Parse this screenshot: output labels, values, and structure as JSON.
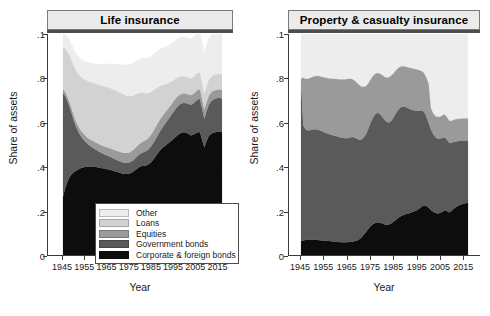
{
  "figure": {
    "panels": [
      {
        "key": "life",
        "title": "Life insurance",
        "ylabel": "Share of assets",
        "xlabel": "Year"
      },
      {
        "key": "pc",
        "title": "Property & casualty insurance",
        "ylabel": "Share of assets",
        "xlabel": "Year"
      }
    ],
    "y_ticks": [
      "0",
      ".2",
      ".4",
      ".6",
      ".8",
      ".1"
    ],
    "y_tick_values": [
      0,
      0.2,
      0.4,
      0.6,
      0.8,
      1.0
    ],
    "x_ticks": [
      "1945",
      "1955",
      "1965",
      "1975",
      "1985",
      "1995",
      "2005",
      "2015"
    ],
    "x_tick_values": [
      1945,
      1955,
      1965,
      1975,
      1985,
      1995,
      2005,
      2015
    ]
  },
  "legend": {
    "items": [
      {
        "label": "Other",
        "color": "#ededed"
      },
      {
        "label": "Loans",
        "color": "#d2d2d2"
      },
      {
        "label": "Equities",
        "color": "#9a9a9a"
      },
      {
        "label": "Government bonds",
        "color": "#5a5a5a"
      },
      {
        "label": "Corporate & foreign bonds",
        "color": "#0d0d0d"
      }
    ]
  },
  "chart_data": [
    {
      "type": "area",
      "stacked": true,
      "title": "Life insurance",
      "xlabel": "Year",
      "ylabel": "Share of assets",
      "xlim": [
        1942,
        2020
      ],
      "ylim": [
        0,
        1
      ],
      "grid": false,
      "legend_position": "inside-bottom-center",
      "x": [
        1945,
        1946,
        1947,
        1948,
        1949,
        1950,
        1951,
        1952,
        1953,
        1954,
        1955,
        1956,
        1957,
        1958,
        1959,
        1960,
        1961,
        1962,
        1963,
        1964,
        1965,
        1966,
        1967,
        1968,
        1969,
        1970,
        1971,
        1972,
        1973,
        1974,
        1975,
        1976,
        1977,
        1978,
        1979,
        1980,
        1981,
        1982,
        1983,
        1984,
        1985,
        1986,
        1987,
        1988,
        1989,
        1990,
        1991,
        1992,
        1993,
        1994,
        1995,
        1996,
        1997,
        1998,
        1999,
        2000,
        2001,
        2002,
        2003,
        2004,
        2005,
        2006,
        2007,
        2008,
        2009,
        2010,
        2011,
        2012,
        2013,
        2014,
        2015,
        2016,
        2017
      ],
      "series": [
        {
          "name": "Corporate & foreign bonds",
          "color": "#0d0d0d",
          "values": [
            0.262,
            0.3,
            0.33,
            0.352,
            0.366,
            0.374,
            0.381,
            0.387,
            0.392,
            0.396,
            0.398,
            0.399,
            0.4,
            0.4,
            0.399,
            0.398,
            0.396,
            0.394,
            0.392,
            0.39,
            0.388,
            0.386,
            0.383,
            0.38,
            0.377,
            0.374,
            0.371,
            0.368,
            0.366,
            0.366,
            0.368,
            0.372,
            0.378,
            0.386,
            0.394,
            0.4,
            0.403,
            0.404,
            0.406,
            0.412,
            0.421,
            0.433,
            0.447,
            0.461,
            0.474,
            0.484,
            0.492,
            0.5,
            0.508,
            0.516,
            0.525,
            0.534,
            0.543,
            0.55,
            0.554,
            0.556,
            0.552,
            0.546,
            0.541,
            0.544,
            0.55,
            0.556,
            0.555,
            0.52,
            0.487,
            0.516,
            0.538,
            0.548,
            0.553,
            0.556,
            0.558,
            0.558,
            0.556
          ]
        },
        {
          "name": "Government bonds",
          "color": "#5a5a5a",
          "values": [
            0.47,
            0.42,
            0.368,
            0.318,
            0.272,
            0.232,
            0.198,
            0.17,
            0.148,
            0.13,
            0.116,
            0.105,
            0.096,
            0.089,
            0.083,
            0.078,
            0.074,
            0.07,
            0.067,
            0.064,
            0.062,
            0.06,
            0.058,
            0.056,
            0.054,
            0.053,
            0.052,
            0.051,
            0.05,
            0.05,
            0.05,
            0.051,
            0.052,
            0.054,
            0.056,
            0.058,
            0.06,
            0.063,
            0.066,
            0.069,
            0.072,
            0.075,
            0.078,
            0.082,
            0.087,
            0.092,
            0.098,
            0.104,
            0.11,
            0.116,
            0.122,
            0.127,
            0.13,
            0.132,
            0.133,
            0.133,
            0.134,
            0.136,
            0.139,
            0.142,
            0.145,
            0.148,
            0.151,
            0.14,
            0.128,
            0.135,
            0.142,
            0.146,
            0.149,
            0.151,
            0.152,
            0.152,
            0.152
          ]
        },
        {
          "name": "Equities",
          "color": "#9a9a9a",
          "values": [
            0.018,
            0.018,
            0.019,
            0.02,
            0.021,
            0.022,
            0.023,
            0.024,
            0.025,
            0.026,
            0.027,
            0.028,
            0.029,
            0.03,
            0.031,
            0.032,
            0.033,
            0.034,
            0.035,
            0.036,
            0.037,
            0.038,
            0.039,
            0.04,
            0.041,
            0.042,
            0.043,
            0.044,
            0.045,
            0.045,
            0.045,
            0.046,
            0.046,
            0.047,
            0.047,
            0.048,
            0.049,
            0.05,
            0.051,
            0.052,
            0.053,
            0.054,
            0.054,
            0.054,
            0.053,
            0.052,
            0.051,
            0.05,
            0.049,
            0.048,
            0.047,
            0.046,
            0.045,
            0.044,
            0.043,
            0.043,
            0.043,
            0.043,
            0.043,
            0.043,
            0.043,
            0.043,
            0.043,
            0.042,
            0.041,
            0.041,
            0.041,
            0.04,
            0.04,
            0.039,
            0.039,
            0.039,
            0.039
          ]
        },
        {
          "name": "Loans",
          "color": "#d2d2d2",
          "values": [
            0.188,
            0.196,
            0.204,
            0.212,
            0.219,
            0.226,
            0.232,
            0.238,
            0.243,
            0.248,
            0.252,
            0.256,
            0.259,
            0.262,
            0.264,
            0.266,
            0.268,
            0.269,
            0.27,
            0.271,
            0.272,
            0.272,
            0.272,
            0.272,
            0.271,
            0.27,
            0.268,
            0.266,
            0.263,
            0.26,
            0.256,
            0.251,
            0.246,
            0.24,
            0.234,
            0.228,
            0.222,
            0.215,
            0.208,
            0.2,
            0.192,
            0.183,
            0.173,
            0.162,
            0.151,
            0.141,
            0.131,
            0.121,
            0.112,
            0.104,
            0.097,
            0.091,
            0.086,
            0.082,
            0.079,
            0.077,
            0.076,
            0.076,
            0.076,
            0.076,
            0.076,
            0.076,
            0.076,
            0.074,
            0.072,
            0.072,
            0.072,
            0.071,
            0.071,
            0.07,
            0.07,
            0.07,
            0.07
          ]
        },
        {
          "name": "Other",
          "color": "#ededed",
          "values": [
            0.062,
            0.066,
            0.069,
            0.072,
            0.074,
            0.076,
            0.078,
            0.08,
            0.081,
            0.082,
            0.084,
            0.085,
            0.086,
            0.088,
            0.09,
            0.092,
            0.094,
            0.097,
            0.1,
            0.103,
            0.106,
            0.11,
            0.113,
            0.117,
            0.121,
            0.125,
            0.129,
            0.133,
            0.137,
            0.14,
            0.143,
            0.146,
            0.149,
            0.151,
            0.153,
            0.155,
            0.157,
            0.159,
            0.161,
            0.162,
            0.163,
            0.164,
            0.165,
            0.166,
            0.167,
            0.168,
            0.169,
            0.17,
            0.171,
            0.172,
            0.173,
            0.174,
            0.175,
            0.176,
            0.177,
            0.178,
            0.179,
            0.18,
            0.181,
            0.182,
            0.183,
            0.184,
            0.185,
            0.186,
            0.187,
            0.188,
            0.189,
            0.19,
            0.191,
            0.192,
            0.193,
            0.194,
            0.195
          ]
        }
      ]
    },
    {
      "type": "area",
      "stacked": true,
      "title": "Property & casualty insurance",
      "xlabel": "Year",
      "ylabel": "Share of assets",
      "xlim": [
        1942,
        2020
      ],
      "ylim": [
        0,
        1
      ],
      "grid": false,
      "legend_position": "none",
      "x": [
        1945,
        1946,
        1947,
        1948,
        1949,
        1950,
        1951,
        1952,
        1953,
        1954,
        1955,
        1956,
        1957,
        1958,
        1959,
        1960,
        1961,
        1962,
        1963,
        1964,
        1965,
        1966,
        1967,
        1968,
        1969,
        1970,
        1971,
        1972,
        1973,
        1974,
        1975,
        1976,
        1977,
        1978,
        1979,
        1980,
        1981,
        1982,
        1983,
        1984,
        1985,
        1986,
        1987,
        1988,
        1989,
        1990,
        1991,
        1992,
        1993,
        1994,
        1995,
        1996,
        1997,
        1998,
        1999,
        2000,
        2001,
        2002,
        2003,
        2004,
        2005,
        2006,
        2007,
        2008,
        2009,
        2010,
        2011,
        2012,
        2013,
        2014,
        2015,
        2016,
        2017
      ],
      "series": [
        {
          "name": "Corporate & foreign bonds",
          "color": "#0d0d0d",
          "values": [
            0.062,
            0.066,
            0.068,
            0.069,
            0.07,
            0.07,
            0.069,
            0.068,
            0.067,
            0.066,
            0.065,
            0.064,
            0.063,
            0.062,
            0.061,
            0.06,
            0.059,
            0.058,
            0.058,
            0.058,
            0.058,
            0.059,
            0.06,
            0.062,
            0.065,
            0.07,
            0.078,
            0.09,
            0.104,
            0.118,
            0.13,
            0.139,
            0.145,
            0.148,
            0.146,
            0.142,
            0.138,
            0.136,
            0.138,
            0.144,
            0.152,
            0.16,
            0.168,
            0.175,
            0.18,
            0.184,
            0.187,
            0.19,
            0.194,
            0.198,
            0.203,
            0.21,
            0.218,
            0.224,
            0.222,
            0.214,
            0.204,
            0.196,
            0.19,
            0.188,
            0.19,
            0.196,
            0.202,
            0.198,
            0.192,
            0.2,
            0.21,
            0.218,
            0.224,
            0.228,
            0.232,
            0.234,
            0.236
          ]
        },
        {
          "name": "Government bonds",
          "color": "#5a5a5a",
          "values": [
            0.728,
            0.52,
            0.5,
            0.494,
            0.495,
            0.498,
            0.5,
            0.5,
            0.498,
            0.494,
            0.49,
            0.487,
            0.484,
            0.482,
            0.48,
            0.478,
            0.476,
            0.474,
            0.472,
            0.47,
            0.47,
            0.472,
            0.474,
            0.47,
            0.462,
            0.452,
            0.444,
            0.44,
            0.442,
            0.452,
            0.468,
            0.482,
            0.492,
            0.496,
            0.492,
            0.484,
            0.474,
            0.466,
            0.462,
            0.464,
            0.472,
            0.482,
            0.49,
            0.494,
            0.492,
            0.486,
            0.478,
            0.47,
            0.462,
            0.456,
            0.45,
            0.444,
            0.436,
            0.424,
            0.406,
            0.384,
            0.364,
            0.35,
            0.342,
            0.338,
            0.336,
            0.334,
            0.33,
            0.322,
            0.314,
            0.308,
            0.302,
            0.296,
            0.292,
            0.288,
            0.286,
            0.284,
            0.282
          ]
        },
        {
          "name": "Equities",
          "color": "#9a9a9a",
          "values": [
            0.008,
            0.216,
            0.228,
            0.234,
            0.236,
            0.238,
            0.24,
            0.242,
            0.244,
            0.246,
            0.248,
            0.25,
            0.252,
            0.254,
            0.256,
            0.258,
            0.26,
            0.262,
            0.264,
            0.266,
            0.268,
            0.266,
            0.262,
            0.258,
            0.254,
            0.248,
            0.24,
            0.23,
            0.218,
            0.206,
            0.196,
            0.188,
            0.182,
            0.18,
            0.182,
            0.188,
            0.194,
            0.2,
            0.204,
            0.204,
            0.2,
            0.194,
            0.188,
            0.184,
            0.182,
            0.182,
            0.184,
            0.186,
            0.188,
            0.188,
            0.186,
            0.182,
            0.178,
            0.176,
            0.176,
            0.178,
            0.096,
            0.094,
            0.096,
            0.098,
            0.1,
            0.102,
            0.104,
            0.102,
            0.1,
            0.1,
            0.1,
            0.1,
            0.1,
            0.1,
            0.1,
            0.1,
            0.1
          ]
        },
        {
          "name": "Loans",
          "color": "#d2d2d2",
          "values": [
            0.002,
            0.002,
            0.002,
            0.002,
            0.002,
            0.002,
            0.002,
            0.002,
            0.002,
            0.002,
            0.002,
            0.002,
            0.002,
            0.002,
            0.002,
            0.002,
            0.002,
            0.002,
            0.002,
            0.002,
            0.002,
            0.002,
            0.002,
            0.002,
            0.002,
            0.002,
            0.002,
            0.002,
            0.002,
            0.002,
            0.002,
            0.002,
            0.002,
            0.002,
            0.002,
            0.002,
            0.002,
            0.002,
            0.002,
            0.002,
            0.002,
            0.002,
            0.002,
            0.002,
            0.002,
            0.002,
            0.002,
            0.002,
            0.002,
            0.002,
            0.002,
            0.002,
            0.002,
            0.002,
            0.002,
            0.002,
            0.002,
            0.002,
            0.002,
            0.002,
            0.002,
            0.002,
            0.002,
            0.002,
            0.002,
            0.002,
            0.002,
            0.002,
            0.002,
            0.002,
            0.002,
            0.002,
            0.002
          ]
        },
        {
          "name": "Other",
          "color": "#ededed",
          "values": [
            0.2,
            0.196,
            0.202,
            0.201,
            0.197,
            0.192,
            0.189,
            0.188,
            0.189,
            0.192,
            0.195,
            0.197,
            0.199,
            0.2,
            0.201,
            0.202,
            0.203,
            0.204,
            0.204,
            0.204,
            0.202,
            0.201,
            0.202,
            0.208,
            0.217,
            0.228,
            0.236,
            0.238,
            0.234,
            0.222,
            0.204,
            0.189,
            0.179,
            0.174,
            0.178,
            0.184,
            0.192,
            0.196,
            0.194,
            0.186,
            0.174,
            0.162,
            0.152,
            0.145,
            0.144,
            0.146,
            0.149,
            0.152,
            0.154,
            0.156,
            0.159,
            0.162,
            0.166,
            0.174,
            0.194,
            0.222,
            0.334,
            0.358,
            0.37,
            0.374,
            0.372,
            0.366,
            0.362,
            0.378,
            0.392,
            0.39,
            0.386,
            0.384,
            0.382,
            0.382,
            0.38,
            0.38,
            0.38
          ]
        }
      ]
    }
  ]
}
